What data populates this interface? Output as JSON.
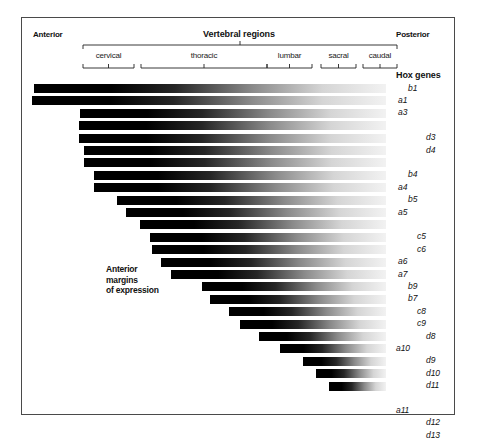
{
  "figure": {
    "anterior_label": "Anterior",
    "posterior_label": "Posterior",
    "vertebral_regions_title": "Vertebral regions",
    "hox_genes_title": "Hox genes",
    "anterior_margins_note_lines": [
      "Anterior",
      "margins",
      "of expression"
    ],
    "border_color": "#4a4a4a",
    "bar_dark_color": "#000000",
    "bar_light_color": "#f2f2f2"
  },
  "regions": [
    {
      "name": "cervical",
      "x1": 61,
      "x2": 112
    },
    {
      "name": "thoracic",
      "x1": 119,
      "x2": 245
    },
    {
      "name": "lumbar",
      "x1": 245,
      "x2": 290
    },
    {
      "name": "sacral",
      "x1": 299,
      "x2": 334
    },
    {
      "name": "caudal",
      "x1": 341,
      "x2": 375
    }
  ],
  "chart_data": {
    "type": "bar",
    "xlabel": "Anterior → Posterior (vertebral regions)",
    "ylabel": "Hox genes",
    "grid": false,
    "legend": "none",
    "axis_regions": [
      "cervical",
      "thoracic",
      "lumbar",
      "sacral",
      "caudal"
    ],
    "note": "Each bar is a black-to-white gradient running left (anterior, strong expression) to right (posterior, fading). Bar start position marks the anterior margin of expression for that Hox gene.",
    "categories": [
      "b1",
      "a1",
      "a3",
      "d3",
      "d4",
      "b4",
      "a4",
      "b5",
      "a5",
      "c5",
      "c6",
      "a6",
      "a7",
      "b9",
      "b7",
      "c8",
      "c9",
      "d8",
      "a10",
      "d9",
      "d10",
      "d11",
      "a11",
      "d12",
      "d13"
    ],
    "bars": [
      {
        "gene": "b1",
        "family": "b",
        "start_x": 12,
        "end_x": 364,
        "row": 0
      },
      {
        "gene": "a1",
        "family": "a",
        "start_x": 10,
        "end_x": 364,
        "row": 1
      },
      {
        "gene": "a3",
        "family": "a",
        "start_x": 58,
        "end_x": 364,
        "row": 2
      },
      {
        "gene": "d3",
        "family": "d",
        "start_x": 57,
        "end_x": 364,
        "row": 3
      },
      {
        "gene": "d4",
        "family": "d",
        "start_x": 57,
        "end_x": 364,
        "row": 4
      },
      {
        "gene": "b4",
        "family": "b",
        "start_x": 62,
        "end_x": 364,
        "row": 5
      },
      {
        "gene": "a4",
        "family": "a",
        "start_x": 62,
        "end_x": 364,
        "row": 6
      },
      {
        "gene": "b5",
        "family": "b",
        "start_x": 72,
        "end_x": 364,
        "row": 7
      },
      {
        "gene": "a5",
        "family": "a",
        "start_x": 72,
        "end_x": 364,
        "row": 8
      },
      {
        "gene": "c5",
        "family": "c",
        "start_x": 95,
        "end_x": 364,
        "row": 9
      },
      {
        "gene": "c6",
        "family": "c",
        "start_x": 104,
        "end_x": 364,
        "row": 10
      },
      {
        "gene": "a6",
        "family": "a",
        "start_x": 118,
        "end_x": 364,
        "row": 11
      },
      {
        "gene": "a7",
        "family": "a",
        "start_x": 128,
        "end_x": 364,
        "row": 12
      },
      {
        "gene": "b9",
        "family": "b",
        "start_x": 130,
        "end_x": 364,
        "row": 13
      },
      {
        "gene": "b7",
        "family": "b",
        "start_x": 139,
        "end_x": 364,
        "row": 14
      },
      {
        "gene": "c8",
        "family": "c",
        "start_x": 149,
        "end_x": 364,
        "row": 15
      },
      {
        "gene": "c9",
        "family": "c",
        "start_x": 180,
        "end_x": 364,
        "row": 16
      },
      {
        "gene": "d8",
        "family": "d",
        "start_x": 188,
        "end_x": 364,
        "row": 17
      },
      {
        "gene": "a10",
        "family": "a",
        "start_x": 207,
        "end_x": 364,
        "row": 18
      },
      {
        "gene": "d9",
        "family": "d",
        "start_x": 218,
        "end_x": 364,
        "row": 19
      },
      {
        "gene": "d10",
        "family": "d",
        "start_x": 237,
        "end_x": 364,
        "row": 20
      },
      {
        "gene": "d11",
        "family": "d",
        "start_x": 258,
        "end_x": 364,
        "row": 21
      },
      {
        "gene": "a11",
        "family": "a",
        "start_x": 281,
        "end_x": 364,
        "row": 22
      },
      {
        "gene": "d12",
        "family": "d",
        "start_x": 294,
        "end_x": 364,
        "row": 23
      },
      {
        "gene": "d13",
        "family": "d",
        "start_x": 307,
        "end_x": 364,
        "row": 24
      }
    ],
    "gene_labels": [
      {
        "text": "b1",
        "row": 0,
        "x": 386
      },
      {
        "text": "a1",
        "row": 1,
        "x": 376
      },
      {
        "text": "a3",
        "row": 2,
        "x": 376
      },
      {
        "text": "d3",
        "row": 4,
        "x": 404
      },
      {
        "text": "d4",
        "row": 5,
        "x": 404
      },
      {
        "text": "b4",
        "row": 7,
        "x": 386
      },
      {
        "text": "a4",
        "row": 8,
        "x": 376
      },
      {
        "text": "b5",
        "row": 9,
        "x": 386
      },
      {
        "text": "a5",
        "row": 10,
        "x": 376
      },
      {
        "text": "c5",
        "row": 12,
        "x": 395
      },
      {
        "text": "c6",
        "row": 13,
        "x": 395
      },
      {
        "text": "a6",
        "row": 14,
        "x": 376
      },
      {
        "text": "a7",
        "row": 15,
        "x": 376
      },
      {
        "text": "b9",
        "row": 16,
        "x": 386
      },
      {
        "text": "b7",
        "row": 17,
        "x": 386
      },
      {
        "text": "c8",
        "row": 18,
        "x": 395
      },
      {
        "text": "c9",
        "row": 19,
        "x": 395
      },
      {
        "text": "d8",
        "row": 20,
        "x": 404
      },
      {
        "text": "a10",
        "row": 21,
        "x": 374
      },
      {
        "text": "d9",
        "row": 22,
        "x": 404
      },
      {
        "text": "d10",
        "row": 23,
        "x": 404
      },
      {
        "text": "d11",
        "row": 24,
        "x": 404
      },
      {
        "text": "a11",
        "row": 26,
        "x": 374
      },
      {
        "text": "d12",
        "row": 27,
        "x": 404
      },
      {
        "text": "d13",
        "row": 28,
        "x": 404
      }
    ]
  }
}
